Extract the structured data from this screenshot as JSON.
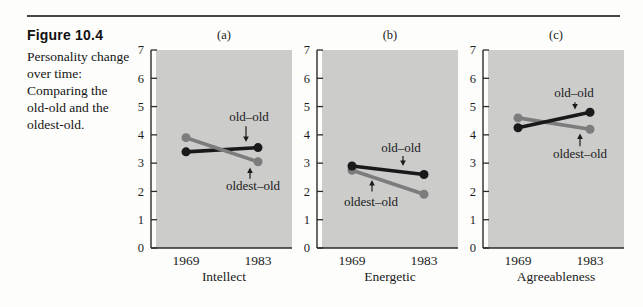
{
  "page": {
    "figure_label": "Figure 10.4",
    "caption_lines": [
      "Personality change",
      "over time:",
      "Comparing the",
      "old-old and the",
      "oldest-old."
    ]
  },
  "style": {
    "plot_bg": "#cccccb",
    "axis": "#2b2b2b",
    "text": "#1b1b1b"
  },
  "chart_data": [
    {
      "type": "line",
      "panel_label": "(a)",
      "xlabel": "Intellect",
      "categories": [
        "1969",
        "1983"
      ],
      "ylim": [
        0,
        7
      ],
      "yticks": [
        0,
        1,
        2,
        3,
        4,
        5,
        6,
        7
      ],
      "grid": false,
      "legend": "annotated-arrows",
      "series": [
        {
          "name": "old-old",
          "color": "#191919",
          "values": [
            3.4,
            3.55
          ]
        },
        {
          "name": "oldest-old",
          "color": "#7c7c7c",
          "values": [
            3.9,
            3.05
          ]
        }
      ],
      "annotations": [
        {
          "text": "old–old",
          "lx": 93,
          "ly": 4.65,
          "ax": 90,
          "from": 4.3,
          "to": 3.75
        },
        {
          "text": "oldest–old",
          "lx": 97,
          "ly": 2.2,
          "ax": 94,
          "from": 2.45,
          "to": 2.85
        }
      ]
    },
    {
      "type": "line",
      "panel_label": "(b)",
      "xlabel": "Energetic",
      "categories": [
        "1969",
        "1983"
      ],
      "ylim": [
        0,
        7
      ],
      "yticks": [
        0,
        1,
        2,
        3,
        4,
        5,
        6,
        7
      ],
      "grid": false,
      "legend": "annotated-arrows",
      "series": [
        {
          "name": "oldest-old",
          "color": "#7c7c7c",
          "values": [
            2.75,
            1.9
          ]
        },
        {
          "name": "old-old",
          "color": "#191919",
          "values": [
            2.9,
            2.6
          ]
        }
      ],
      "annotations": [
        {
          "text": "old–old",
          "lx": 79,
          "ly": 3.55,
          "ax": 81,
          "from": 3.25,
          "to": 2.9
        },
        {
          "text": "oldest–old",
          "lx": 49,
          "ly": 1.65,
          "ax": 50,
          "from": 2.0,
          "to": 2.4
        }
      ]
    },
    {
      "type": "line",
      "panel_label": "(c)",
      "xlabel": "Agreeableness",
      "categories": [
        "1969",
        "1983"
      ],
      "ylim": [
        0,
        7
      ],
      "yticks": [
        0,
        1,
        2,
        3,
        4,
        5,
        6,
        7
      ],
      "grid": false,
      "legend": "annotated-arrows",
      "series": [
        {
          "name": "oldest-old",
          "color": "#7c7c7c",
          "values": [
            4.6,
            4.2
          ]
        },
        {
          "name": "old-old",
          "color": "#191919",
          "values": [
            4.25,
            4.8
          ]
        }
      ],
      "annotations": [
        {
          "text": "old–old",
          "lx": 86,
          "ly": 5.5,
          "ax": 87,
          "from": 5.15,
          "to": 4.9
        },
        {
          "text": "oldest–old",
          "lx": 92,
          "ly": 3.35,
          "ax": 92,
          "from": 3.6,
          "to": 4.05
        }
      ]
    }
  ]
}
